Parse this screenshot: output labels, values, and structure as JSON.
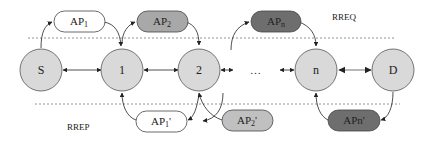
{
  "diagram": {
    "labels": {
      "rreq": "RREQ",
      "rrep": "RREP",
      "ellipsis": "…"
    },
    "nodes": [
      {
        "id": "S",
        "label": "S"
      },
      {
        "id": "1",
        "label": "1"
      },
      {
        "id": "2",
        "label": "2"
      },
      {
        "id": "n",
        "label": "n"
      },
      {
        "id": "D",
        "label": "D"
      }
    ],
    "request_aps": [
      {
        "base": "AP",
        "sub": "1",
        "fill": "#ffffff"
      },
      {
        "base": "AP",
        "sub": "2",
        "fill": "#a8a8a8"
      },
      {
        "base": "AP",
        "sub": "n",
        "fill": "#6e6e6e"
      }
    ],
    "reply_aps": [
      {
        "base": "AP",
        "sub": "1",
        "prime": "'",
        "fill": "#ffffff"
      },
      {
        "base": "AP",
        "sub": "2",
        "prime": "'",
        "fill": "#c0c0c0"
      },
      {
        "base": "APn'",
        "fill": "#6e6e6e"
      }
    ],
    "colors": {
      "node_fill": "#d9d9d9",
      "stroke": "#444444",
      "dashed_line": "#777777"
    }
  }
}
